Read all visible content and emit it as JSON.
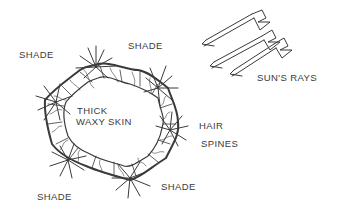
{
  "diagram": {
    "labels": {
      "shade_top_left": "SHADE",
      "shade_top_right": "SHADE",
      "shade_bottom_left": "SHADE",
      "shade_bottom_right": "SHADE",
      "thick_waxy_skin_line1": "THICK",
      "thick_waxy_skin_line2": "WAXY SKIN",
      "hair_spines_line1": "HAIR",
      "hair_spines_line2": "SPINES",
      "suns_rays": "SUN'S RAYS"
    },
    "arrows": {
      "count": 3,
      "direction": "down-left"
    },
    "colors": {
      "ink": "#3a3a3a",
      "background": "#ffffff"
    }
  }
}
